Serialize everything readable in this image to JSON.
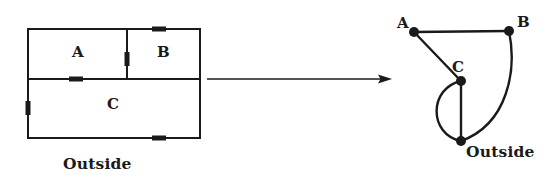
{
  "figure": {
    "kind": "floor-plan-to-graph-transformation",
    "arrow": {
      "name": "transformation-arrow",
      "direction": "right",
      "x1": 207,
      "x2": 392,
      "y": 79
    }
  },
  "floor_plan": {
    "caption": "Outside",
    "bounds": {
      "x": 28,
      "y": 29,
      "width": 172,
      "height": 109
    },
    "interior_walls": {
      "horizontal_y": 79,
      "vertical_x": 127
    },
    "rooms": [
      {
        "id": "A",
        "label": "A",
        "x": 72,
        "y": 45
      },
      {
        "id": "B",
        "label": "B",
        "x": 157,
        "y": 45
      },
      {
        "id": "C",
        "label": "C",
        "x": 107,
        "y": 97
      }
    ],
    "doors": [
      {
        "name": "door-b-outside-top",
        "orientation": "horizontal",
        "x": 152,
        "y": 29,
        "length": 14,
        "connects": [
          "B",
          "Outside"
        ]
      },
      {
        "name": "door-a-b",
        "orientation": "vertical",
        "x": 127,
        "y": 52,
        "length": 14,
        "connects": [
          "A",
          "B"
        ]
      },
      {
        "name": "door-a-c",
        "orientation": "horizontal",
        "x": 69,
        "y": 79,
        "length": 14,
        "connects": [
          "A",
          "C"
        ]
      },
      {
        "name": "door-c-outside-left",
        "orientation": "vertical",
        "x": 28,
        "y": 101,
        "length": 14,
        "connects": [
          "C",
          "Outside"
        ]
      },
      {
        "name": "door-c-outside-bottom",
        "orientation": "horizontal",
        "x": 152,
        "y": 138,
        "length": 14,
        "connects": [
          "C",
          "Outside"
        ]
      }
    ]
  },
  "graph": {
    "nodes": [
      {
        "id": "A",
        "label": "A",
        "cx": 414,
        "cy": 32,
        "label_x": 397,
        "label_y": 16
      },
      {
        "id": "B",
        "label": "B",
        "cx": 509,
        "cy": 31,
        "label_x": 517,
        "label_y": 15
      },
      {
        "id": "C",
        "label": "C",
        "cx": 461,
        "cy": 81,
        "label_x": 452,
        "label_y": 60
      },
      {
        "id": "Outside",
        "label": "Outside",
        "cx": 461,
        "cy": 141,
        "label_x": 466,
        "label_y": 144
      }
    ],
    "edges": [
      {
        "name": "edge-a-b",
        "from": "A",
        "to": "B",
        "shape": "straight"
      },
      {
        "name": "edge-a-c",
        "from": "A",
        "to": "C",
        "shape": "straight"
      },
      {
        "name": "edge-c-outside",
        "from": "C",
        "to": "Outside",
        "shape": "straight"
      },
      {
        "name": "edge-c-outside-curve",
        "from": "C",
        "to": "Outside",
        "shape": "curve-left"
      },
      {
        "name": "edge-b-outside",
        "from": "B",
        "to": "Outside",
        "shape": "curve-right"
      }
    ],
    "node_radius": 5
  },
  "style": {
    "ink": "#1a1a1a",
    "background": "#ffffff",
    "wall_stroke": 2,
    "edge_stroke": 2.4
  }
}
